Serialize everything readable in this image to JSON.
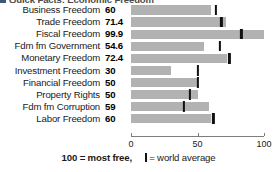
{
  "title_clipped": "Quick Facts: Economic Freedom",
  "footnote": {
    "most_free": "100 = most free,",
    "world_average": "= world average"
  },
  "colors": {
    "bar": "#b2b2b2",
    "tick": "#111111",
    "axis": "#7d7d7d",
    "text": "#1a1a1a"
  },
  "chart_data": {
    "type": "bar",
    "orientation": "horizontal",
    "title": "Quick Facts: Economic Freedom",
    "xlabel": "",
    "ylabel": "",
    "xlim": [
      0,
      100
    ],
    "grid": false,
    "legend": "100 = most free,  | = world average",
    "axis_ticks": [
      {
        "value": 0,
        "label": "0"
      },
      {
        "value": 50,
        "label": "50"
      },
      {
        "value": 100,
        "label": "100"
      }
    ],
    "categories": [
      "Business Freedom",
      "Trade Freedom",
      "Fiscal Freedom",
      "Fdm fm Government",
      "Monetary Freedom",
      "Investment Freedom",
      "Financial Freedom",
      "Property Rights",
      "Fdm fm Corruption",
      "Labor Freedom"
    ],
    "values": [
      60,
      71.4,
      99.9,
      54.6,
      72.4,
      30,
      50,
      50,
      59,
      60
    ],
    "value_labels": [
      "60",
      "71.4",
      "99.9",
      "54.6",
      "72.4",
      "30",
      "50",
      "50",
      "59",
      "60"
    ],
    "series": [
      {
        "name": "Country score",
        "values": [
          60,
          71.4,
          99.9,
          54.6,
          72.4,
          30,
          50,
          50,
          59,
          60
        ]
      },
      {
        "name": "World average",
        "values": [
          64,
          68,
          83,
          67,
          74,
          50,
          50,
          44,
          40,
          62
        ]
      }
    ],
    "rows": [
      {
        "label": "Business Freedom",
        "value": 60,
        "value_label": "60",
        "world_average": 64
      },
      {
        "label": "Trade Freedom",
        "value": 71.4,
        "value_label": "71.4",
        "world_average": 68
      },
      {
        "label": "Fiscal Freedom",
        "value": 99.9,
        "value_label": "99.9",
        "world_average": 83
      },
      {
        "label": "Fdm fm Government",
        "value": 54.6,
        "value_label": "54.6",
        "world_average": 67
      },
      {
        "label": "Monetary Freedom",
        "value": 72.4,
        "value_label": "72.4",
        "world_average": 74
      },
      {
        "label": "Investment Freedom",
        "value": 30,
        "value_label": "30",
        "world_average": 50
      },
      {
        "label": "Financial Freedom",
        "value": 50,
        "value_label": "50",
        "world_average": 50
      },
      {
        "label": "Property Rights",
        "value": 50,
        "value_label": "50",
        "world_average": 44
      },
      {
        "label": "Fdm fm Corruption",
        "value": 59,
        "value_label": "59",
        "world_average": 40
      },
      {
        "label": "Labor Freedom",
        "value": 60,
        "value_label": "60",
        "world_average": 62
      }
    ]
  }
}
